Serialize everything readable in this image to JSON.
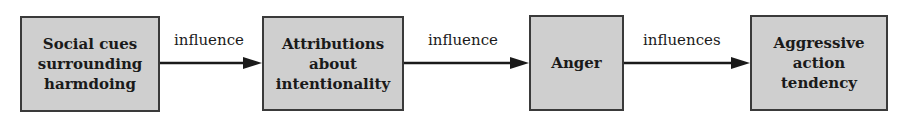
{
  "diagram": {
    "type": "flowchart",
    "direction": "left-to-right",
    "colors": {
      "box_fill": "#cfcfcf",
      "box_border": "#3a3a3a",
      "arrow": "#1a1a1a",
      "background": "#ffffff"
    },
    "nodes": [
      {
        "id": "social-cues",
        "label": "Social cues\nsurrounding\nharmdoing"
      },
      {
        "id": "attributions",
        "label": "Attributions\nabout\nintentionality"
      },
      {
        "id": "anger",
        "label": "Anger"
      },
      {
        "id": "aggressive-action",
        "label": "Aggressive\naction\ntendency"
      }
    ],
    "edges": [
      {
        "from": "social-cues",
        "to": "attributions",
        "label": "influence"
      },
      {
        "from": "attributions",
        "to": "anger",
        "label": "influence"
      },
      {
        "from": "anger",
        "to": "aggressive-action",
        "label": "influences"
      }
    ]
  }
}
